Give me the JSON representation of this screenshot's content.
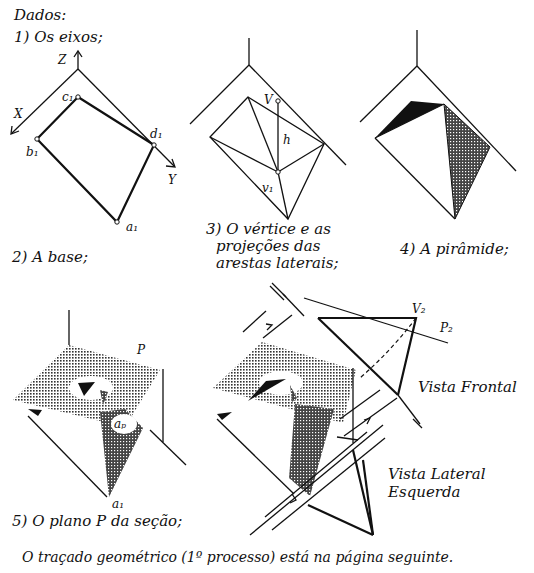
{
  "header": {
    "title": "Dados:"
  },
  "steps": [
    {
      "label": "1) Os eixos;"
    },
    {
      "label": "2) A base;"
    },
    {
      "label": "3) O vértice e as projeções das arestas laterais;",
      "lines": [
        "3) O vértice e as",
        "projeções das",
        "arestas laterais;"
      ]
    },
    {
      "label": "4) A pirâmide;"
    },
    {
      "label": "5) O plano P da seção;"
    }
  ],
  "axes": {
    "z": "Z",
    "x": "X",
    "y": "Y"
  },
  "base_points": {
    "a": "a₁",
    "b": "b₁",
    "c": "c₁",
    "d": "d₁"
  },
  "vertex": {
    "v": "V",
    "h": "h",
    "v1": "v₁"
  },
  "section": {
    "plane": "P",
    "ap": "aₚ",
    "a1": "a₁"
  },
  "views": {
    "v2": "V₂",
    "p2": "P₂",
    "frontal": "Vista Frontal",
    "lateral_line1": "Vista Lateral",
    "lateral_line2": "Esquerda"
  },
  "footer": {
    "note": "O traçado geométrico (1º processo) está na página seguinte."
  },
  "colors": {
    "ink": "#111111",
    "paper": "#ffffff"
  }
}
